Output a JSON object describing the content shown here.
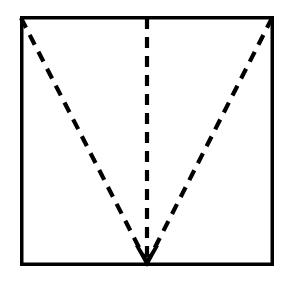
{
  "figure": {
    "title": "Square with three dashed lines converging to an arrow at bottom center",
    "kind": "geometric-diagram",
    "canvas": {
      "width": 286,
      "height": 286,
      "background": "#ffffff"
    },
    "stroke_color": "#000000",
    "square": {
      "name": "outer-square",
      "left": 20,
      "top": 16,
      "right": 274,
      "bottom": 266,
      "width": 254,
      "height": 250,
      "stroke_width": 3.5,
      "fill": "none",
      "style": "solid"
    },
    "convergence_point": {
      "x": 147,
      "y": 266,
      "label": ""
    },
    "dashed_lines": [
      {
        "name": "left-diagonal",
        "from": {
          "x": 21,
          "y": 18
        },
        "to": {
          "x": 147,
          "y": 263
        },
        "style": "dashed",
        "stroke_width": 4.2,
        "dash": 11,
        "gap": 8
      },
      {
        "name": "center-vertical",
        "from": {
          "x": 147,
          "y": 18
        },
        "to": {
          "x": 147,
          "y": 263
        },
        "style": "dashed",
        "stroke_width": 4.2,
        "dash": 11,
        "gap": 8
      },
      {
        "name": "right-diagonal",
        "from": {
          "x": 272,
          "y": 18
        },
        "to": {
          "x": 147,
          "y": 263
        },
        "style": "dashed",
        "stroke_width": 4.2,
        "dash": 11,
        "gap": 8
      }
    ],
    "arrowhead": {
      "name": "down-arrowhead",
      "direction": "down",
      "tip": {
        "x": 147,
        "y": 267
      },
      "width": 24,
      "height": 21,
      "fill": "#000000",
      "style": "filled-chevron"
    },
    "labels": []
  }
}
